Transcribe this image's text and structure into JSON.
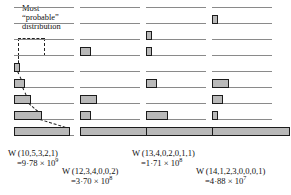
{
  "figure": {
    "annotation": {
      "line1": "Most",
      "line2": "“probable”",
      "line3": "distribution"
    },
    "grid": {
      "level_count": 9,
      "level_spacing_px": 16,
      "top_level_y": 7,
      "line_color": "#8a8a8a"
    },
    "bar_style": {
      "fill": "#b9b9b9",
      "stroke": "#1c1c1c",
      "unit_width_px": 5.6,
      "height_px": 9
    },
    "columns": [
      {
        "id": "column-1",
        "x": 14,
        "line_length": 60,
        "caption": {
          "w_symbol": "W",
          "distribution": "(10,5,3,2,1)",
          "equals": "=9·78 × 10",
          "exponent": "9"
        },
        "populations": [
          {
            "level": 5,
            "value": 1
          },
          {
            "level": 6,
            "value": 2
          },
          {
            "level": 7,
            "value": 3
          },
          {
            "level": 8,
            "value": 5
          },
          {
            "level": 9,
            "value": 10
          }
        ]
      },
      {
        "id": "column-2",
        "x": 80,
        "line_length": 60,
        "caption": {
          "w_symbol": "W",
          "distribution": "(12,3,4,0,0,2)",
          "equals": "=3·70 × 10",
          "exponent": "8"
        },
        "populations": [
          {
            "level": 4,
            "value": 2
          },
          {
            "level": 7,
            "value": 3
          },
          {
            "level": 8,
            "value": 2
          },
          {
            "level": 9,
            "value": 12
          }
        ]
      },
      {
        "id": "column-3",
        "x": 146,
        "line_length": 60,
        "caption": {
          "w_symbol": "W",
          "distribution": "(13,4,0,2,0,1,1)",
          "equals": "=1·71 × 10",
          "exponent": "8"
        },
        "populations": [
          {
            "level": 3,
            "value": 1
          },
          {
            "level": 4,
            "value": 1
          },
          {
            "level": 6,
            "value": 2
          },
          {
            "level": 8,
            "value": 4
          },
          {
            "level": 9,
            "value": 13
          }
        ]
      },
      {
        "id": "column-4",
        "x": 212,
        "line_length": 60,
        "caption": {
          "w_symbol": "W",
          "distribution": "(14,1,2,3,0,0,0,1)",
          "equals": "=4·88 × 10",
          "exponent": "7"
        },
        "populations": [
          {
            "level": 2,
            "value": 1
          },
          {
            "level": 6,
            "value": 3
          },
          {
            "level": 7,
            "value": 2
          },
          {
            "level": 8,
            "value": 1
          },
          {
            "level": 9,
            "value": 14
          }
        ]
      }
    ],
    "captions_layout": [
      {
        "column": 0,
        "x": 8,
        "y": 148
      },
      {
        "column": 1,
        "x": 62,
        "y": 166
      },
      {
        "column": 2,
        "x": 132,
        "y": 148
      },
      {
        "column": 3,
        "x": 196,
        "y": 166
      }
    ]
  },
  "chart_data": {
    "type": "bar",
    "xlabel": "Number of molecules in level",
    "ylabel": "Energy level",
    "grid": true,
    "legend": "none",
    "categories": [
      "level 1",
      "level 2",
      "level 3",
      "level 4",
      "level 5",
      "level 6",
      "level 7",
      "level 8",
      "level 9"
    ],
    "series": [
      {
        "name": "W(10,5,3,2,1)",
        "weight": "9·78 × 10^9",
        "values": [
          0,
          0,
          0,
          0,
          1,
          2,
          3,
          5,
          10
        ]
      },
      {
        "name": "W(12,3,4,0,0,2)",
        "weight": "3·70 × 10^8",
        "values": [
          0,
          0,
          0,
          2,
          0,
          0,
          3,
          2,
          12
        ]
      },
      {
        "name": "W(13,4,0,2,0,1,1)",
        "weight": "1·71 × 10^8",
        "values": [
          0,
          0,
          1,
          1,
          0,
          2,
          0,
          4,
          13
        ]
      },
      {
        "name": "W(14,1,2,3,0,0,0,1)",
        "weight": "4·88 × 10^7",
        "values": [
          0,
          1,
          0,
          0,
          0,
          3,
          2,
          1,
          14
        ]
      }
    ],
    "annotations": [
      "Most “probable” distribution"
    ]
  }
}
